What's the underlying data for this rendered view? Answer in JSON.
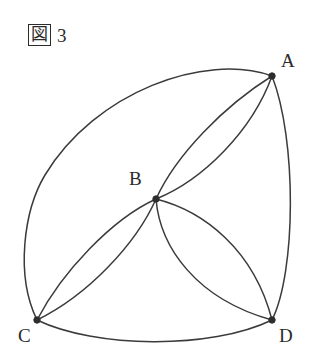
{
  "figure": {
    "caption_kanji": "図",
    "caption_number": "3",
    "caption_full": "図 3",
    "background_color": "#ffffff",
    "stroke_color": "#3b3b3b",
    "vertex_color": "#2e2e2e",
    "label_color": "#2b2b2b",
    "width": 317,
    "height": 363
  },
  "chart_data": {
    "type": "diagram",
    "title": "図 3",
    "vertices": [
      {
        "id": "A",
        "label": "A",
        "x": 272,
        "y": 76,
        "label_x": 281,
        "label_y": 51
      },
      {
        "id": "B",
        "label": "B",
        "x": 156,
        "y": 199,
        "label_x": 129,
        "label_y": 169
      },
      {
        "id": "C",
        "label": "C",
        "x": 37,
        "y": 320,
        "label_x": 18,
        "label_y": 326
      },
      {
        "id": "D",
        "label": "D",
        "x": 272,
        "y": 320,
        "label_x": 279,
        "label_y": 326
      }
    ],
    "arcs": [
      {
        "id": "outer-arc-a-c",
        "from": "A",
        "to": "C",
        "bulge": "upper-left",
        "path": "M 272 76 C 205 52, 95 92, 45 175 C 24 210, 15 275, 37 320"
      },
      {
        "id": "outer-arc-c-d",
        "from": "C",
        "to": "D",
        "bulge": "down",
        "path": "M 37 320 C 95 348, 210 350, 272 320"
      },
      {
        "id": "outer-arc-d-a",
        "from": "D",
        "to": "A",
        "bulge": "right",
        "path": "M 272 320 C 296 272, 297 140, 272 76"
      },
      {
        "id": "lens-b-a-upper",
        "from": "B",
        "to": "A",
        "bulge": "upper-left",
        "path": "M 156 199 C 176 155, 224 106, 272 76"
      },
      {
        "id": "lens-b-a-lower",
        "from": "B",
        "to": "A",
        "bulge": "lower-right",
        "path": "M 156 199 C 203 180, 252 131, 272 76"
      },
      {
        "id": "lens-b-c-upper",
        "from": "B",
        "to": "C",
        "bulge": "upper-left",
        "path": "M 156 199 C 112 219, 62 272, 37 320"
      },
      {
        "id": "lens-b-c-lower",
        "from": "B",
        "to": "C",
        "bulge": "lower-right",
        "path": "M 156 199 C 136 244, 88 295, 37 320"
      },
      {
        "id": "lens-b-d-left",
        "from": "B",
        "to": "D",
        "bulge": "lower-left",
        "path": "M 156 199 C 160 247, 196 299, 272 320"
      },
      {
        "id": "lens-b-d-right",
        "from": "B",
        "to": "D",
        "bulge": "upper-right",
        "path": "M 156 199 C 204 211, 254 250, 272 320"
      }
    ],
    "arc_count": 9,
    "vertex_count": 4,
    "grid": false,
    "legend": false
  }
}
